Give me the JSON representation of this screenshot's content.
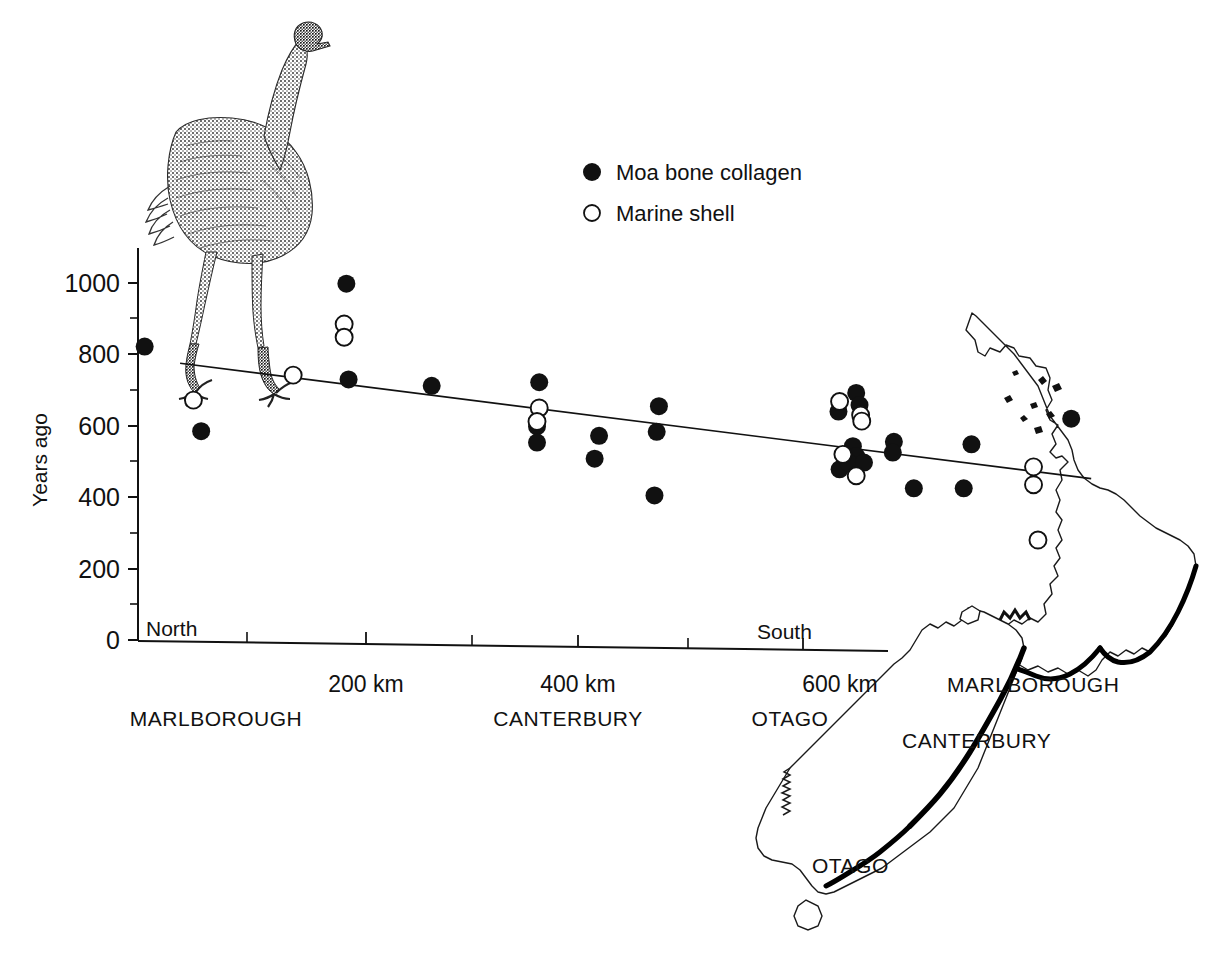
{
  "figure": {
    "ylabel": "Years ago",
    "north_label": "North",
    "south_label": "South"
  },
  "legend": {
    "items": [
      {
        "marker": "filled-circle",
        "label": "Moa bone collagen"
      },
      {
        "marker": "open-circle",
        "label": "Marine shell"
      }
    ]
  },
  "axes": {
    "y_ticks": [
      "0",
      "200",
      "400",
      "600",
      "800",
      "1000"
    ],
    "x_ticks": [
      "200 km",
      "400 km",
      "600 km"
    ],
    "regions": [
      "MARLBOROUGH",
      "CANTERBURY",
      "OTAGO"
    ]
  },
  "map_labels": [
    "MARLBOROUGH",
    "CANTERBURY",
    "OTAGO"
  ],
  "illustration": {
    "name": "moa-bird-engraving"
  },
  "chart_data": {
    "type": "scatter",
    "title": "",
    "xlabel": "Distance along North-South transect (km)",
    "ylabel": "Years ago",
    "xlim": [
      0,
      700
    ],
    "ylim": [
      0,
      1050
    ],
    "x_tick_values": [
      100,
      200,
      300,
      400,
      500,
      600,
      700
    ],
    "x_tick_labels": [
      "",
      "200 km",
      "",
      "400 km",
      "",
      "600 km",
      ""
    ],
    "y_tick_values": [
      0,
      100,
      200,
      300,
      400,
      500,
      600,
      700,
      800,
      900,
      1000
    ],
    "y_tick_labels": [
      "0",
      "",
      "200",
      "",
      "400",
      "",
      "600",
      "",
      "800",
      "",
      "1000"
    ],
    "grid": false,
    "legend_position": "top-center",
    "series": [
      {
        "name": "Moa bone collagen",
        "marker": "filled-circle",
        "points": [
          {
            "x": 6,
            "y": 822
          },
          {
            "x": 57,
            "y": 585
          },
          {
            "x": 188,
            "y": 998
          },
          {
            "x": 190,
            "y": 730
          },
          {
            "x": 265,
            "y": 712
          },
          {
            "x": 362,
            "y": 722
          },
          {
            "x": 360,
            "y": 598
          },
          {
            "x": 360,
            "y": 553
          },
          {
            "x": 416,
            "y": 572
          },
          {
            "x": 412,
            "y": 508
          },
          {
            "x": 470,
            "y": 655
          },
          {
            "x": 468,
            "y": 583
          },
          {
            "x": 466,
            "y": 405
          },
          {
            "x": 632,
            "y": 640
          },
          {
            "x": 633,
            "y": 478
          },
          {
            "x": 648,
            "y": 692
          },
          {
            "x": 651,
            "y": 658
          },
          {
            "x": 645,
            "y": 543
          },
          {
            "x": 648,
            "y": 515
          },
          {
            "x": 641,
            "y": 497
          },
          {
            "x": 655,
            "y": 497
          },
          {
            "x": 682,
            "y": 555
          },
          {
            "x": 681,
            "y": 525
          },
          {
            "x": 700,
            "y": 425
          },
          {
            "x": 745,
            "y": 425
          },
          {
            "x": 752,
            "y": 548
          },
          {
            "x": 842,
            "y": 620
          }
        ]
      },
      {
        "name": "Marine shell",
        "marker": "open-circle",
        "points": [
          {
            "x": 50,
            "y": 672
          },
          {
            "x": 140,
            "y": 742
          },
          {
            "x": 186,
            "y": 885
          },
          {
            "x": 186,
            "y": 848
          },
          {
            "x": 362,
            "y": 650
          },
          {
            "x": 360,
            "y": 612
          },
          {
            "x": 633,
            "y": 668
          },
          {
            "x": 652,
            "y": 630
          },
          {
            "x": 653,
            "y": 613
          },
          {
            "x": 636,
            "y": 520
          },
          {
            "x": 648,
            "y": 460
          },
          {
            "x": 808,
            "y": 485
          },
          {
            "x": 808,
            "y": 435
          },
          {
            "x": 812,
            "y": 280
          }
        ]
      }
    ],
    "trendline": {
      "name": "regression-line",
      "x_start": 38,
      "y_start": 775,
      "x_end": 860,
      "y_end": 452,
      "style": "solid-thin"
    }
  }
}
